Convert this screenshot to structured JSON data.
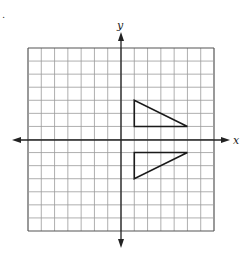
{
  "diagram": {
    "type": "coordinate-grid",
    "marker": ".",
    "axes": {
      "x_label": "x",
      "y_label": "y"
    },
    "grid": {
      "xmin": -7,
      "xmax": 7,
      "ymin": -7,
      "ymax": 7,
      "step": 1
    },
    "colors": {
      "grid": "#9a9a9a",
      "axis": "#222222",
      "shape": "#1a1a1a",
      "background": "#ffffff"
    },
    "shapes": [
      {
        "name": "triangle-upper",
        "vertices": [
          [
            1,
            3
          ],
          [
            1,
            1
          ],
          [
            5,
            1
          ]
        ]
      },
      {
        "name": "triangle-lower",
        "vertices": [
          [
            1,
            -1
          ],
          [
            5,
            -1
          ],
          [
            1,
            -3
          ]
        ]
      }
    ]
  }
}
